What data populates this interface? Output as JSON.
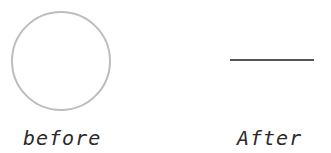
{
  "panels": [
    {
      "id": "before",
      "caption": "before",
      "shape": "circle",
      "shape_color": "#bdbdbd",
      "circle": {
        "cx": 61,
        "cy": 61,
        "r": 49,
        "stroke_width": 2
      }
    },
    {
      "id": "after",
      "caption": "After",
      "shape": "line",
      "shape_color": "#555555",
      "line": {
        "x1": 65,
        "y1": 60,
        "x2": 149,
        "y2": 60,
        "stroke_width": 2
      }
    }
  ]
}
